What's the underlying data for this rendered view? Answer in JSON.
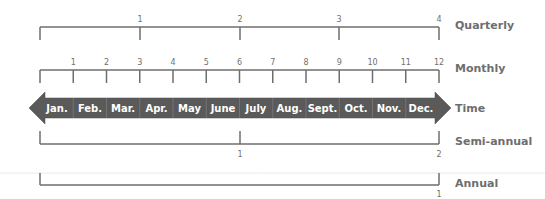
{
  "rows": {
    "quarterly": {
      "label": "Quarterly",
      "ticks": [
        "1",
        "2",
        "3",
        "4"
      ]
    },
    "monthly": {
      "label": "Monthly",
      "ticks": [
        "1",
        "2",
        "3",
        "4",
        "5",
        "6",
        "7",
        "8",
        "9",
        "10",
        "11",
        "12"
      ]
    },
    "time": {
      "label": "Time",
      "months": [
        "Jan.",
        "Feb.",
        "Mar.",
        "Apr.",
        "May",
        "June",
        "July",
        "Aug.",
        "Sept.",
        "Oct.",
        "Nov.",
        "Dec."
      ]
    },
    "semiannual": {
      "label": "Semi-annual",
      "ticks": [
        "1",
        "2"
      ]
    },
    "annual": {
      "label": "Annual",
      "ticks": [
        "1"
      ]
    }
  },
  "colors": {
    "line": "#6e6e6e",
    "arrow": "#5a5a5a",
    "text": "#6e6e6e"
  }
}
